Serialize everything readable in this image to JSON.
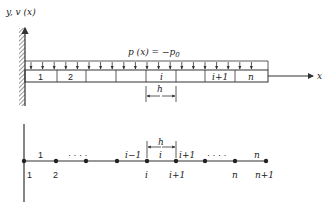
{
  "top": {
    "axis_label": "y, v (x)",
    "load_label": "p (x) = −p",
    "load_sub": "0",
    "x_label": "x",
    "elements": [
      "1",
      "2",
      "",
      "",
      "i",
      "",
      "i+1",
      "n"
    ],
    "h_label": "h"
  },
  "bottom": {
    "element_labels": [
      "1",
      "· · · ·",
      "i−1",
      "i",
      "i+1",
      "· · · ·",
      "n"
    ],
    "node_labels": [
      "1",
      "2",
      "i",
      "i+1",
      "n",
      "n+1"
    ],
    "h_label": "h"
  }
}
